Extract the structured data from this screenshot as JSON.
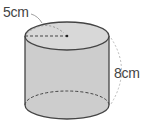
{
  "diagram": {
    "shape": "cylinder",
    "radius_label": "5cm",
    "height_label": "8cm",
    "colors": {
      "body_fill": "#cfcfcf",
      "top_fill": "#d6d6d6",
      "outline": "#444444",
      "dashed": "#444444",
      "dimension_arc": "#999999"
    }
  }
}
